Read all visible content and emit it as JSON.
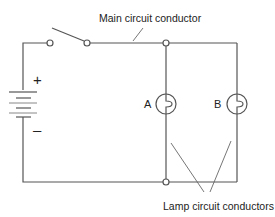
{
  "diagram": {
    "type": "parallel-circuit",
    "labels": {
      "main_conductor": "Main circuit conductor",
      "lamp_conductors": "Lamp circuit conductors",
      "lamp_a": "A",
      "lamp_b": "B",
      "battery_positive": "+",
      "battery_negative": "–"
    },
    "components": [
      {
        "id": "battery",
        "kind": "battery"
      },
      {
        "id": "switch",
        "kind": "switch",
        "state": "open"
      },
      {
        "id": "lamp-a",
        "kind": "lamp",
        "label": "A"
      },
      {
        "id": "lamp-b",
        "kind": "lamp",
        "label": "B"
      }
    ],
    "colors": {
      "wire": "#555555",
      "text": "#222222",
      "background": "#ffffff"
    }
  }
}
